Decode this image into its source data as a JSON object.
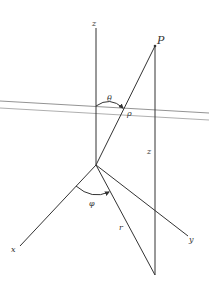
{
  "diagram": {
    "labels": {
      "z_axis": "z",
      "x_axis": "x",
      "y_axis": "y",
      "point": "P",
      "theta": "θ",
      "rho": "ρ",
      "z_height": "z",
      "phi": "φ",
      "r": "r"
    },
    "colors": {
      "line": "#333333",
      "plane": "#888888",
      "background": "#ffffff"
    }
  }
}
